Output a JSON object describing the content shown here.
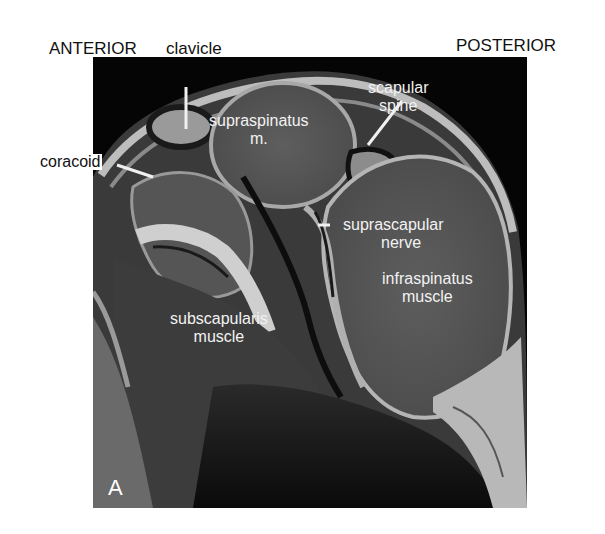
{
  "figure": {
    "panel_letter": "A",
    "orientation": {
      "anterior": "ANTERIOR",
      "posterior": "POSTERIOR"
    },
    "labels": {
      "clavicle": "clavicle",
      "coracoid": "coracoid",
      "supraspinatus_line1": "supraspinatus",
      "supraspinatus_line2": "m.",
      "scapular_spine_line1": "scapular",
      "scapular_spine_line2": "spine",
      "suprascapular_nerve_line1": "suprascapular",
      "suprascapular_nerve_line2": "nerve",
      "infraspinatus_line1": "infraspinatus",
      "infraspinatus_line2": "muscle",
      "subscapularis_line1": "subscapularis",
      "subscapularis_line2": "muscle"
    },
    "colors": {
      "background": "#ffffff",
      "mri_black": "#050505",
      "muscle_gray": "#5a5a5a",
      "fat_bright": "#cfcfcf",
      "label_white": "#f2f2f2",
      "label_black": "#111111"
    }
  }
}
